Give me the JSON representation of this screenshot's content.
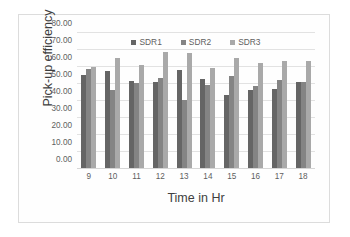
{
  "chart_data": {
    "type": "bar",
    "title": "",
    "xlabel": "Time in Hr",
    "ylabel": "Pick-up efficiency",
    "categories": [
      "9",
      "10",
      "11",
      "12",
      "13",
      "14",
      "15",
      "16",
      "17",
      "18"
    ],
    "series": [
      {
        "name": "SDR1",
        "color": "#656565",
        "values": [
          55.0,
          57.5,
          51.5,
          51.0,
          58.0,
          53.0,
          43.5,
          46.5,
          47.0,
          51.0
        ]
      },
      {
        "name": "SDR2",
        "color": "#848484",
        "values": [
          58.5,
          46.5,
          50.5,
          53.5,
          40.5,
          49.0,
          54.5,
          48.5,
          52.0,
          51.0
        ]
      },
      {
        "name": "SDR3",
        "color": "#a9a9a9",
        "values": [
          60.0,
          65.0,
          61.0,
          68.5,
          68.0,
          59.5,
          65.0,
          62.0,
          63.5,
          63.5
        ]
      }
    ],
    "ylim": [
      0,
      80
    ],
    "ytick_step": 10,
    "ytick_labels": [
      "0.00",
      "10.00",
      "20.00",
      "30.00",
      "40.00",
      "50.00",
      "60.00",
      "70.00",
      "80.00"
    ],
    "grid": "horizontal",
    "legend_position": "top-center"
  }
}
